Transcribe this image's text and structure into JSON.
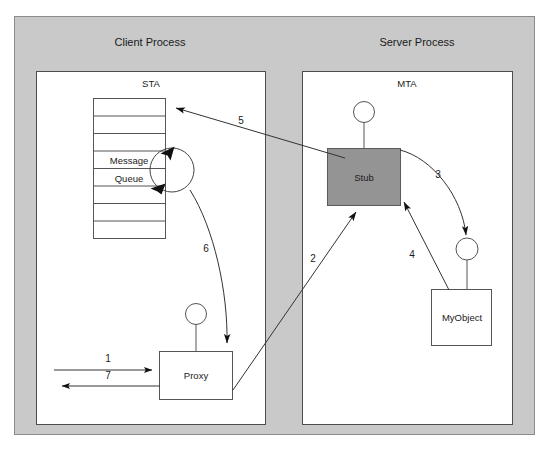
{
  "diagram": {
    "colors": {
      "outer_frame_fill": "#c9c9c9",
      "outer_frame_stroke": "#8c8c8c",
      "apartment_fill": "#ffffff",
      "apartment_stroke": "#4d4d4d",
      "stub_fill": "#949494",
      "stub_stroke": "#5a5a5a",
      "box_fill": "#ffffff",
      "box_stroke": "#555555",
      "line": "#333333",
      "text": "#1a1a1a"
    },
    "processes": [
      {
        "id": "client",
        "label": "Client Process"
      },
      {
        "id": "server",
        "label": "Server Process"
      }
    ],
    "apartments": [
      {
        "id": "sta",
        "label": "STA"
      },
      {
        "id": "mta",
        "label": "MTA"
      }
    ],
    "components": {
      "message_queue": {
        "label_line1": "Message",
        "label_line2": "Queue",
        "cell_count": 8
      },
      "proxy": {
        "label": "Proxy"
      },
      "stub": {
        "label": "Stub"
      },
      "myobject": {
        "label": "MyObject"
      }
    },
    "steps": [
      {
        "id": "1",
        "label": "1",
        "from": "caller",
        "to": "proxy"
      },
      {
        "id": "2",
        "label": "2",
        "from": "proxy",
        "to": "stub"
      },
      {
        "id": "3",
        "label": "3",
        "from": "stub",
        "to": "myobject"
      },
      {
        "id": "4",
        "label": "4",
        "from": "myobject",
        "to": "stub"
      },
      {
        "id": "5",
        "label": "5",
        "from": "stub",
        "to": "message-queue"
      },
      {
        "id": "6",
        "label": "6",
        "from": "message-queue",
        "to": "proxy"
      },
      {
        "id": "7",
        "label": "7",
        "from": "proxy",
        "to": "caller"
      }
    ]
  }
}
